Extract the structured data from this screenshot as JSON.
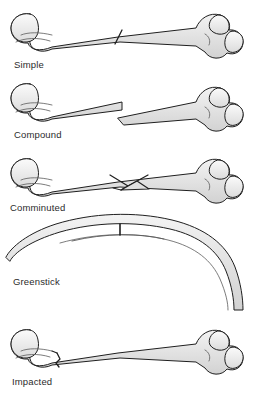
{
  "illustration": {
    "title": "Types of bone fractures",
    "subject": "long bone (femur)",
    "background_color": "#ffffff",
    "bone_fill_color": "#e9e9e9",
    "bone_outline_color": "#1f1f1f",
    "bone_shading_color": "#c9c9c9",
    "caption_color": "#2b2b2b"
  },
  "panels": [
    {
      "id": "simple",
      "label": "Simple",
      "icon": "bone-simple-fracture-icon",
      "description": "Intact long bone with one clean oblique fracture line across the shaft",
      "fracture_lines": 1,
      "displaced": false,
      "orientation": "horizontal"
    },
    {
      "id": "compound",
      "label": "Compound",
      "icon": "bone-compound-fracture-icon",
      "description": "Long bone broken into two displaced fragments with sharp offset ends",
      "fracture_lines": 1,
      "displaced": true,
      "orientation": "horizontal"
    },
    {
      "id": "comminuted",
      "label": "Comminuted",
      "icon": "bone-comminuted-fracture-icon",
      "description": "Shaft shattered into multiple fragments including a wedge butterfly piece",
      "fracture_lines": 3,
      "displaced": true,
      "orientation": "horizontal"
    },
    {
      "id": "greenstick",
      "label": "Greenstick",
      "icon": "bone-greenstick-fracture-icon",
      "description": "Bone bent into an arc with an incomplete crack on the convex outer surface",
      "fracture_lines": 1,
      "displaced": false,
      "orientation": "curved-arc"
    },
    {
      "id": "impacted",
      "label": "Impacted",
      "icon": "bone-impacted-fracture-icon",
      "description": "Fracture near the proximal end where fragments are driven into each other",
      "fracture_lines": 1,
      "displaced": false,
      "orientation": "horizontal"
    }
  ]
}
